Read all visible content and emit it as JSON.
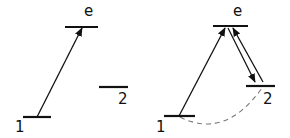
{
  "panels": [
    {
      "id": "left",
      "levels": [
        {
          "name": "e",
          "label": "e",
          "x1": 65,
          "x2": 98,
          "y": 27,
          "lx": 84,
          "ly": 16
        },
        {
          "name": "1",
          "label": "1",
          "x1": 23,
          "x2": 51,
          "y": 117,
          "lx": 15,
          "ly": 132
        },
        {
          "name": "2",
          "label": "2",
          "x1": 99,
          "x2": 128,
          "y": 87,
          "lx": 118,
          "ly": 104
        }
      ],
      "arrows": [
        {
          "name": "excitation-1-to-e",
          "x1": 37,
          "y1": 117,
          "x2": 82,
          "y2": 28
        }
      ],
      "dashed": []
    },
    {
      "id": "right",
      "levels": [
        {
          "name": "e",
          "label": "e",
          "x1": 213,
          "x2": 248,
          "y": 26,
          "lx": 233,
          "ly": 16
        },
        {
          "name": "1",
          "label": "1",
          "x1": 164,
          "x2": 195,
          "y": 116,
          "lx": 156,
          "ly": 132
        },
        {
          "name": "2",
          "label": "2",
          "x1": 246,
          "x2": 275,
          "y": 86,
          "lx": 263,
          "ly": 104
        }
      ],
      "arrows": [
        {
          "name": "excitation-1-to-e",
          "x1": 179,
          "y1": 116,
          "x2": 225,
          "y2": 28
        },
        {
          "name": "emission-e-to-2",
          "x1": 228,
          "y1": 28,
          "x2": 255,
          "y2": 82
        },
        {
          "name": "excitation-2-to-e",
          "x1": 263,
          "y1": 82,
          "x2": 233,
          "y2": 28
        }
      ],
      "dashed": [
        {
          "name": "coherence-1-2",
          "d": "M 180 117 Q 225 140 262 88"
        }
      ]
    }
  ],
  "colors": {
    "ink": "#111111",
    "dash": "#777777",
    "background": "#ffffff"
  }
}
